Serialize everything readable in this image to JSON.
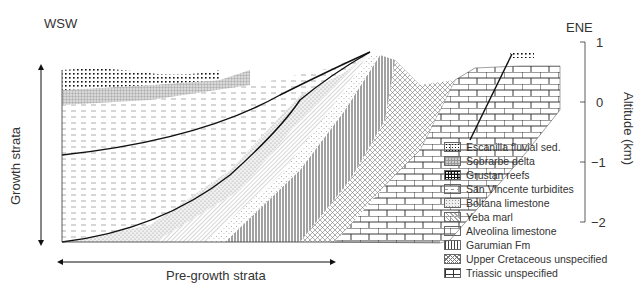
{
  "diagram": {
    "type": "geological cross-section",
    "direction_left": "WSW",
    "direction_right": "ENE",
    "vertical_arrow_label": "Growth strata",
    "horizontal_arrow_label": "Pre-growth strata",
    "axis": {
      "title": "Altitude (km)",
      "ticks": [
        "1",
        "0",
        "−1",
        "−2"
      ]
    },
    "legend": [
      {
        "label": "Escanilla fluvial sed.",
        "pattern": "dots"
      },
      {
        "label": "Sobrarbe delta",
        "pattern": "fine-grid"
      },
      {
        "label": "Grustan reefs",
        "pattern": "bold-grid"
      },
      {
        "label": "San Vincente turbidites",
        "pattern": "dashes"
      },
      {
        "label": "Boltana limestone",
        "pattern": "stipple"
      },
      {
        "label": "Yeba marl",
        "pattern": "diagonal-lines"
      },
      {
        "label": "Alveolina limestone",
        "pattern": "sparse-stipple"
      },
      {
        "label": "Garumian Fm",
        "pattern": "vertical-lines"
      },
      {
        "label": "Upper Cretaceous unspecified",
        "pattern": "crosshatch"
      },
      {
        "label": "Triassic unspecified",
        "pattern": "bricks"
      }
    ]
  }
}
